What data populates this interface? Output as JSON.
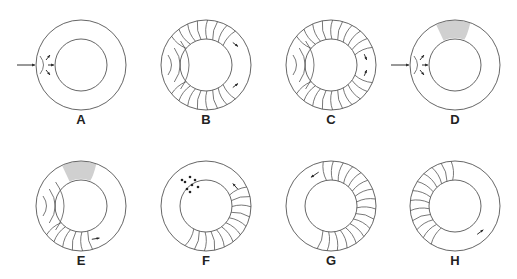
{
  "figure": {
    "panels": [
      {
        "label": "A",
        "stimulus": "left",
        "refractory": false,
        "wavefronts": "none",
        "arrows": "radial-burst"
      },
      {
        "label": "B",
        "stimulus": "none",
        "refractory": false,
        "wavefronts": "bidirectional-full",
        "arrows": "two-clockwise-and-counter"
      },
      {
        "label": "C",
        "stimulus": "none",
        "refractory": false,
        "wavefronts": "bidirectional-collision",
        "arrows": "two-colliding"
      },
      {
        "label": "D",
        "stimulus": "left",
        "refractory": true,
        "wavefronts": "none",
        "arrows": "radial-burst"
      },
      {
        "label": "E",
        "stimulus": "none",
        "refractory": true,
        "wavefronts": "lower-half",
        "arrows": "one-counterclockwise"
      },
      {
        "label": "F",
        "stimulus": "none",
        "refractory": false,
        "dots": true,
        "wavefronts": "right-and-lower",
        "arrows": "one-upward"
      },
      {
        "label": "G",
        "stimulus": "none",
        "refractory": false,
        "wavefronts": "top-right",
        "arrows": "one-leftward"
      },
      {
        "label": "H",
        "stimulus": "none",
        "refractory": false,
        "wavefronts": "left-and-lower",
        "arrows": "one-rightward"
      }
    ],
    "colors": {
      "line": "#555555",
      "refractory": "#d0d0d0",
      "text": "#222222"
    }
  }
}
